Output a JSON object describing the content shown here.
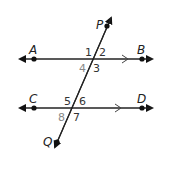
{
  "diagram": {
    "type": "parallel lines cut by transversal",
    "points": {
      "A": "A",
      "B": "B",
      "C": "C",
      "D": "D",
      "P": "P",
      "Q": "Q"
    },
    "angles": [
      "1",
      "2",
      "3",
      "4",
      "5",
      "6",
      "7",
      "8"
    ],
    "colors": {
      "line": "#222222",
      "angle_label": "#333333",
      "angle_label_gray": "#888888"
    }
  }
}
